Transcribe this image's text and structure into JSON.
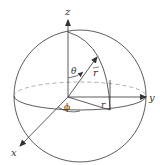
{
  "diagram": {
    "axes": {
      "x_label": "x",
      "y_label": "y",
      "z_label": "z"
    },
    "labels": {
      "theta": "θ",
      "phi": "ϕ",
      "r_vector": "r",
      "r_proj": "r"
    },
    "colors": {
      "stroke": "#333333",
      "dashed": "#999999",
      "background": "#ffffff"
    }
  }
}
